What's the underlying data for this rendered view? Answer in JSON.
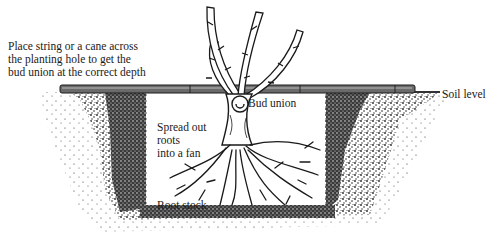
{
  "diagram": {
    "labels": {
      "instruction": [
        "Place string or a cane across",
        "the planting hole to get the",
        "bud union at the correct depth"
      ],
      "soil_level": "Soil level",
      "bud_union": "Bud union",
      "spread_roots": [
        "Spread out",
        "roots",
        "into a fan"
      ],
      "root_stock": "Root stock"
    },
    "elements": {
      "cane": "horizontal cane across planting hole",
      "hole": "rectangular planting hole in soil",
      "plant": "rose bush with five thorny canes",
      "roots": "fanned-out root system"
    },
    "colors": {
      "ink": "#1a1a1a",
      "soil": "#2b2b2b",
      "cane": "#5a5a5a",
      "background": "#ffffff"
    }
  }
}
